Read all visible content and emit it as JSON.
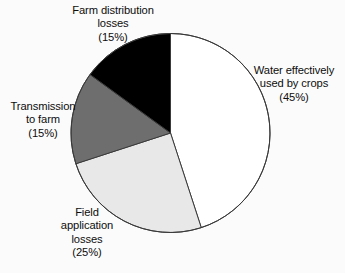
{
  "figure": {
    "background_color": "#fbfbfb",
    "text_color": "#0d0d0d"
  },
  "chart_data": {
    "type": "pie",
    "title": "",
    "subtitle": "",
    "xlabel": "",
    "ylabel": "",
    "legend_position": "none",
    "grid": false,
    "labels_placement": "outside-callout-free",
    "start_angle_deg_clockwise_from_top": 0,
    "direction": "clockwise",
    "center": {
      "cx": 170.5,
      "cy": 133.0
    },
    "radius": 99.5,
    "outline_color": "#3a3a3a",
    "outline_width": 1,
    "categories": [
      "Water effectively used by crops",
      "Field application losses",
      "Transmission to farm",
      "Farm distribution losses"
    ],
    "values": [
      45,
      25,
      15,
      15
    ],
    "value_unit": "%",
    "colors": [
      "#ffffff",
      "#e8e8e8",
      "#6e6e6e",
      "#000000"
    ],
    "slices": [
      {
        "name": "water-effectively-used-by-crops",
        "label_lines": [
          "Water effectively",
          "used by crops",
          "(45%)"
        ],
        "value": 45,
        "percent_text": "(45%)",
        "color": "#ffffff",
        "start_deg": 0,
        "end_deg": 162
      },
      {
        "name": "field-application-losses",
        "label_lines": [
          "Field",
          "application",
          "losses",
          "(25%)"
        ],
        "value": 25,
        "percent_text": "(25%)",
        "color": "#e8e8e8",
        "start_deg": 162,
        "end_deg": 252
      },
      {
        "name": "transmission-to-farm",
        "label_lines": [
          "Transmission",
          "to farm",
          "(15%)"
        ],
        "value": 15,
        "percent_text": "(15%)",
        "color": "#6e6e6e",
        "start_deg": 252,
        "end_deg": 306
      },
      {
        "name": "farm-distribution-losses",
        "label_lines": [
          "Farm distribution",
          "losses",
          "(15%)"
        ],
        "value": 15,
        "percent_text": "(15%)",
        "color": "#000000",
        "start_deg": 306,
        "end_deg": 360
      }
    ]
  },
  "labels": {
    "farm_distribution_losses": {
      "line1": "Farm distribution",
      "line2": "losses",
      "line3": "(15%)"
    },
    "water_used_by_crops": {
      "line1": "Water effectively",
      "line2": "used by crops",
      "line3": "(45%)"
    },
    "transmission_to_farm": {
      "line1": "Transmission",
      "line2": "to farm",
      "line3": "(15%)"
    },
    "field_application_losses": {
      "line1": "Field",
      "line2": "application",
      "line3": "losses",
      "line4": "(25%)"
    }
  }
}
